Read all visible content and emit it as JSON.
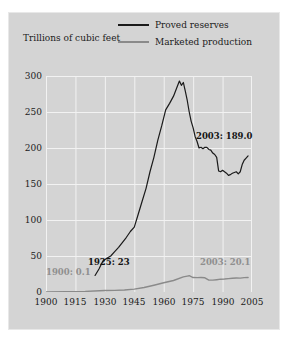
{
  "chart_data": {
    "type": "line",
    "title": "",
    "subtitle": "",
    "xlabel": "",
    "ylabel": "Trillions of cubic feet",
    "xlim": [
      1900,
      2005
    ],
    "ylim": [
      0,
      300
    ],
    "grid": true,
    "legend_position": "top-center",
    "xticks": [
      "1900",
      "1915",
      "1930",
      "1945",
      "1960",
      "1975",
      "1990",
      "2005"
    ],
    "yticks": [
      "0",
      "50",
      "100",
      "150",
      "200",
      "250",
      "300"
    ],
    "series": [
      {
        "name": "Proved reserves",
        "color": "#1a1a1a",
        "x": [
          1925,
          1927,
          1929,
          1931,
          1933,
          1935,
          1937,
          1939,
          1941,
          1943,
          1945,
          1947,
          1949,
          1951,
          1953,
          1955,
          1957,
          1959,
          1961,
          1963,
          1965,
          1967,
          1968,
          1969,
          1970,
          1971,
          1972,
          1973,
          1974,
          1975,
          1976,
          1977,
          1978,
          1979,
          1980,
          1981,
          1982,
          1983,
          1984,
          1985,
          1986,
          1987,
          1988,
          1989,
          1990,
          1991,
          1992,
          1993,
          1994,
          1995,
          1996,
          1997,
          1998,
          1999,
          2000,
          2001,
          2002,
          2003
        ],
        "y": [
          23,
          32,
          43,
          47,
          50,
          56,
          62,
          69,
          76,
          84,
          90,
          108,
          126,
          144,
          167,
          187,
          211,
          231,
          253,
          262,
          272,
          286,
          293,
          287,
          291,
          279,
          266,
          250,
          237,
          228,
          216,
          209,
          200,
          201,
          199,
          201,
          201,
          198,
          197,
          193,
          191,
          187,
          168,
          167,
          169,
          167,
          165,
          162,
          163,
          165,
          166,
          167,
          164,
          167,
          177,
          183,
          186,
          189
        ]
      },
      {
        "name": "Marketed production",
        "color": "#8a8a8a",
        "x": [
          1900,
          1910,
          1920,
          1930,
          1935,
          1940,
          1945,
          1950,
          1955,
          1960,
          1965,
          1970,
          1972,
          1973,
          1975,
          1977,
          1979,
          1981,
          1983,
          1985,
          1987,
          1989,
          1991,
          1993,
          1995,
          1997,
          1999,
          2001,
          2003
        ],
        "y": [
          0.1,
          0.5,
          0.8,
          2.0,
          2.2,
          2.7,
          4.0,
          6.3,
          9.4,
          12.8,
          16.0,
          21.0,
          22.1,
          22.6,
          20.1,
          19.9,
          20.1,
          19.7,
          16.5,
          16.5,
          17.1,
          17.8,
          18.0,
          18.6,
          19.1,
          19.5,
          19.3,
          20.0,
          20.1
        ]
      }
    ],
    "annotations": [
      {
        "text": "1900: 0.1",
        "style": "muted",
        "left": 46,
        "top": 268
      },
      {
        "text": "1925: 23",
        "style": "dark",
        "left": 88,
        "top": 258
      },
      {
        "text": "2003: 189.0",
        "style": "dark",
        "left": 196,
        "top": 132
      },
      {
        "text": "2003: 20.1",
        "style": "muted",
        "left": 202,
        "top": 258
      }
    ]
  },
  "legend": {
    "items": [
      {
        "label": "Proved reserves",
        "swatch": "reserves"
      },
      {
        "label": "Marketed production",
        "swatch": "production"
      }
    ]
  },
  "colors": {
    "panel_background": "#d4d4d4",
    "gridline": "#f2f2f2",
    "reserves_line": "#1a1a1a",
    "production_line": "#8a8a8a",
    "text": "#1b1b1b"
  }
}
